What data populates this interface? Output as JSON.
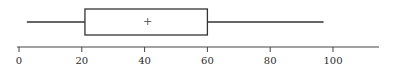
{
  "chart_data": {
    "type": "boxplot",
    "title": "",
    "xlabel": "",
    "ylabel": "",
    "orientation": "horizontal",
    "xlim": [
      0,
      110
    ],
    "x_ticks": [
      0,
      20,
      40,
      60,
      80,
      100
    ],
    "x_tick_labels": [
      "0",
      "20",
      "40",
      "60",
      "80",
      "100"
    ],
    "grid": false,
    "legend": null,
    "series": [
      {
        "name": "",
        "min": 2.5,
        "q1": 21,
        "median": null,
        "mean": 41,
        "q3": 60,
        "max": 97
      }
    ],
    "annotations": [
      "+ marks the mean"
    ]
  },
  "colors": {
    "line": "#333333",
    "background": "#ffffff"
  },
  "layout": {
    "px_origin": 19,
    "px_per_unit": 3.14,
    "box_top": 9,
    "box_bottom": 35,
    "whisker_y": 22,
    "axis_y": 47,
    "axis_end_x": 379
  }
}
